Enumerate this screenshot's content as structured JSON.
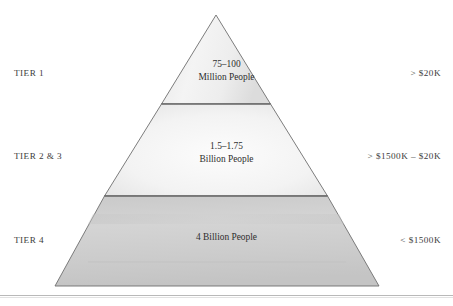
{
  "diagram": {
    "type": "pyramid",
    "title": "",
    "orientation": "apex-up",
    "tier_count": 3,
    "geometry": {
      "apex": [
        216,
        15
      ],
      "base_left": [
        55,
        286
      ],
      "base_right": [
        379,
        286
      ],
      "divider_1_y": 104,
      "divider_2_y": 196
    },
    "tiers": [
      {
        "id": "tier-1",
        "left_label": "TIER 1",
        "population_line_1": "75–100",
        "population_line_2": "Million People",
        "right_label": "> $20K",
        "fill_hex": "#f2f2f2"
      },
      {
        "id": "tier-2-3",
        "left_label": "TIER 2 & 3",
        "population_line_1": "1.5–1.75",
        "population_line_2": "Billion People",
        "right_label": "> $1500K – $20K",
        "fill_hex": "#f4f4f4"
      },
      {
        "id": "tier-4",
        "left_label": "TIER 4",
        "population_line_1": "4 Billion People",
        "population_line_2": "",
        "right_label": "< $1500K",
        "fill_hex": "#cfcfcf"
      }
    ],
    "colors": {
      "outline": "#6b6b6b",
      "divider": "#5f5f5f",
      "text": "#3a3a3a",
      "rule": "#b9b9b9",
      "background": "#ffffff"
    }
  }
}
